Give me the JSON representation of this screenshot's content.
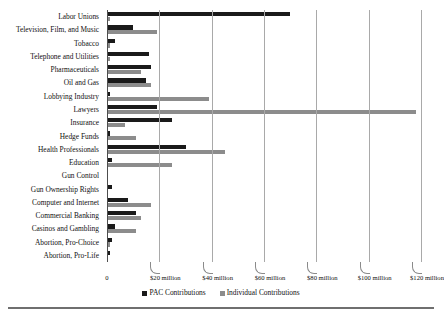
{
  "chart_data": {
    "type": "bar",
    "orientation": "horizontal",
    "title": "",
    "xlabel": "",
    "ylabel": "",
    "xlim": [
      0,
      120
    ],
    "xunit": "million",
    "grid": true,
    "legend_position": "bottom-center",
    "categories": [
      "Labor Unions",
      "Television, Film, and Music",
      "Tobacco",
      "Telephone and Utilities",
      "Pharmaceuticals",
      "Oil and Gas",
      "Lobbying Industry",
      "Lawyers",
      "Insurance",
      "Hedge Funds",
      "Health Professionals",
      "Education",
      "Gun Control",
      "Gun Ownership Rights",
      "Computer and Internet",
      "Commercial Banking",
      "Casinos and Gambling",
      "Abortion, Pro-Choice",
      "Abortion, Pro-Life"
    ],
    "series": [
      {
        "name": "PAC Contributions",
        "color": "#1a1a1a",
        "values": [
          70,
          10,
          3,
          16,
          17,
          15,
          1,
          19,
          25,
          1,
          30,
          2,
          0.5,
          2,
          8,
          11,
          3,
          2,
          1
        ]
      },
      {
        "name": "Individual Contributions",
        "color": "#8c8c8c",
        "values": [
          1,
          19,
          1,
          1,
          13,
          17,
          39,
          118,
          7,
          11,
          45,
          25,
          0.5,
          0.5,
          17,
          13,
          11,
          1,
          0.5
        ]
      }
    ],
    "xticks": [
      {
        "value": 0,
        "label": "0"
      },
      {
        "value": 20,
        "label": "$20 million"
      },
      {
        "value": 40,
        "label": "$40 million"
      },
      {
        "value": 60,
        "label": "$60 million"
      },
      {
        "value": 80,
        "label": "$80 million"
      },
      {
        "value": 100,
        "label": "$100 million"
      },
      {
        "value": 120,
        "label": "$120 million"
      }
    ]
  },
  "legend": {
    "items": [
      {
        "label": "PAC Contributions",
        "key": "pac"
      },
      {
        "label": "Individual Contributions",
        "key": "ind"
      }
    ]
  }
}
